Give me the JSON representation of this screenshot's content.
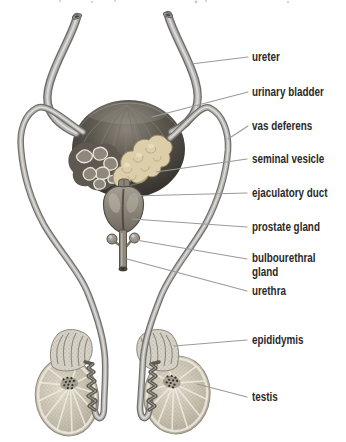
{
  "diagram": {
    "background": "#ffffff"
  },
  "labels": [
    {
      "id": "ureter",
      "text": "ureter"
    },
    {
      "id": "urinary-bladder",
      "text": "urinary bladder"
    },
    {
      "id": "vas-deferens",
      "text": "vas deferens"
    },
    {
      "id": "seminal-vesicle",
      "text": "seminal vesicle"
    },
    {
      "id": "ejaculatory-duct",
      "text": "ejaculatory duct"
    },
    {
      "id": "prostate-gland",
      "text": "prostate gland"
    },
    {
      "id": "bulbourethral-gland",
      "text": "bulbourethral gland"
    },
    {
      "id": "urethra",
      "text": "urethra"
    },
    {
      "id": "epididymis",
      "text": "epididymis"
    },
    {
      "id": "testis",
      "text": "testis"
    }
  ],
  "colors": {
    "label_text": "#2b2a28",
    "leader_line": "#9a9a9a",
    "bladder_dark": "#3c3934",
    "seminal_vesicle_cream": "#dbcea9",
    "tube_gray": "#b3b2af",
    "tissue_light": "#ded8ca",
    "prostate_gray": "#8d867b"
  }
}
